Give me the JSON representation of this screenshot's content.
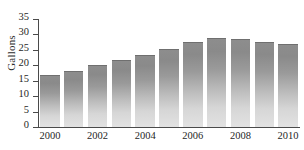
{
  "chart_data": {
    "type": "bar",
    "title": "",
    "subtitle": "",
    "xlabel": "",
    "ylabel": "Gallons",
    "categories": [
      "2000",
      "2001",
      "2002",
      "2003",
      "2004",
      "2005",
      "2006",
      "2007",
      "2008",
      "2009",
      "2010"
    ],
    "values": [
      16.7,
      18.2,
      20.2,
      21.6,
      23.3,
      25.4,
      27.5,
      28.9,
      28.5,
      27.6,
      26.8
    ],
    "ylim": [
      0,
      35
    ],
    "ytick_labels": [
      "0",
      "5",
      "10",
      "15",
      "20",
      "25",
      "30",
      "35"
    ],
    "ytick_values": [
      0,
      5,
      10,
      15,
      20,
      25,
      30,
      35
    ],
    "xtick_labels": [
      "2000",
      "2002",
      "2004",
      "2006",
      "2008",
      "2010"
    ],
    "xtick_label_indices": [
      0,
      2,
      4,
      6,
      8,
      10
    ],
    "grid": false,
    "legend": null,
    "legend_position": "none",
    "annotations": [],
    "colors": {
      "bar_top": "#8a8a8a",
      "bar_bottom": "#e2e2e2",
      "bar_outline": "#6f6f6f",
      "axis": "#4a4a4a",
      "text": "#1f1f1f",
      "background": "#ffffff"
    }
  }
}
